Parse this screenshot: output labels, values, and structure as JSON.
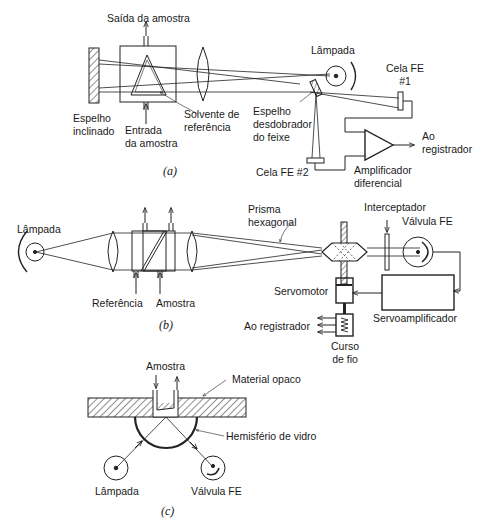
{
  "figure_a": {
    "caption": "(a)",
    "labels": {
      "sample_out": "Saída da amostra",
      "lamp": "Lâmpada",
      "cell1_line1": "Cela FE",
      "cell1_line2": "#1",
      "tilted_mirror_line1": "Espelho",
      "tilted_mirror_line2": "inclinado",
      "sample_in_line1": "Entrada",
      "sample_in_line2": "da amostra",
      "ref_solvent_line1": "Solvente de",
      "ref_solvent_line2": "referência",
      "splitter_line1": "Espelho",
      "splitter_line2": "desdobrador",
      "splitter_line3": "do feixe",
      "to_recorder_line1": "Ao",
      "to_recorder_line2": "registrador",
      "cell2": "Cela FE #2",
      "amp_line1": "Amplificador",
      "amp_line2": "diferencial"
    }
  },
  "figure_b": {
    "caption": "(b)",
    "labels": {
      "lamp": "Lâmpada",
      "reference": "Referência",
      "sample": "Amostra",
      "prism_line1": "Prisma",
      "prism_line2": "hexagonal",
      "chopper": "Interceptador",
      "phototube": "Válvula FE",
      "servomotor": "Servomotor",
      "servoamp": "Servoamplificador",
      "to_recorder": "Ao registrador",
      "slidewire_line1": "Curso",
      "slidewire_line2": "de fio"
    }
  },
  "figure_c": {
    "caption": "(c)",
    "labels": {
      "sample": "Amostra",
      "opaque": "Material opaco",
      "hemisphere": "Hemisfério de vidro",
      "lamp": "Lâmpada",
      "phototube": "Válvula FE"
    }
  }
}
